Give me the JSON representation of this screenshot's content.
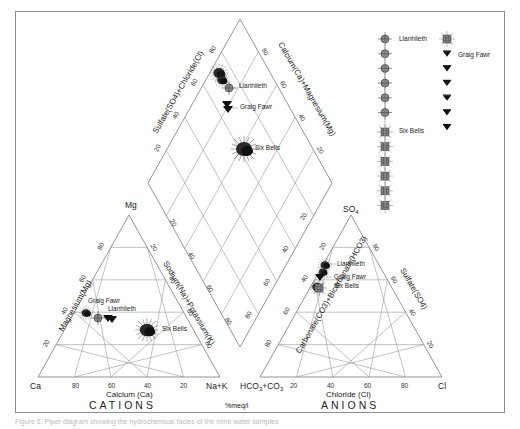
{
  "chart_data": {
    "type": "scatter",
    "subtype": "piper-trilinear",
    "units_label": "%meq/l",
    "cation_triangle": {
      "title": "CATIONS",
      "vertices": {
        "left": "Ca",
        "top": "Mg",
        "right": "Na+K"
      },
      "bottom_axis_label": "Calcium (Ca)",
      "left_axis_label": "Magnesium(Mg)",
      "right_axis_label": "Sodium(Na)+Potassium(K)",
      "ticks": [
        20,
        40,
        60,
        80
      ]
    },
    "anion_triangle": {
      "title": "ANIONS",
      "vertices": {
        "left": "HCO3+CO3",
        "top": "SO4",
        "right": "Cl"
      },
      "bottom_axis_label": "Chloride (Cl)",
      "left_axis_label": "Carbonate(CO3)+Bicarbonate(HCO3)",
      "right_axis_label": "Sulfate(SO4)",
      "ticks": [
        20,
        40,
        60,
        80
      ]
    },
    "diamond": {
      "upper_left_axis_label": "Sulfate(SO4)+Chloride(Cl)",
      "upper_right_axis_label": "Calcium(Ca)+Magnesium(Mg)",
      "lower_left_axis_label": "Sodium(Na)+Potassium(K)",
      "lower_right_axis_label": "Carbonate(CO3)+Bicarbonate(HCO3)",
      "ticks": [
        20,
        40,
        60,
        80
      ]
    },
    "series": [
      {
        "name": "Llanhileth",
        "marker": "circle-cross",
        "cations": {
          "Ca": 62,
          "Mg": 38,
          "NaK": 0
        },
        "anions": {
          "HCO3CO3": 24,
          "SO4": 74,
          "Cl": 2
        },
        "diamond": {
          "SO4Cl": 76,
          "CaMg": 100
        }
      },
      {
        "name": "Graig Fawr",
        "marker": "triangle-down",
        "cations": {
          "Ca": 57,
          "Mg": 38,
          "NaK": 5
        },
        "anions": {
          "HCO3CO3": 30,
          "SO4": 67,
          "Cl": 3
        },
        "diamond": {
          "SO4Cl": 70,
          "CaMg": 95
        }
      },
      {
        "name": "Six Bells",
        "marker": "star-square",
        "cations": {
          "Ca": 38,
          "Mg": 31,
          "NaK": 31
        },
        "anions": {
          "HCO3CO3": 35,
          "SO4": 62,
          "Cl": 3
        },
        "diamond": {
          "SO4Cl": 65,
          "CaMg": 69
        }
      },
      {
        "name": "Llanhileth-cluster",
        "marker": "filled-blob",
        "cations": {
          "Ca": 67,
          "Mg": 39,
          "NaK": 0
        },
        "anions": {
          "HCO3CO3": 20,
          "SO4": 78,
          "Cl": 2
        },
        "diamond": {
          "SO4Cl": 82,
          "CaMg": 100
        }
      }
    ],
    "legend": {
      "position": "top-right",
      "columns": [
        {
          "entries": [
            {
              "label": "Llanhileth",
              "marker": "circle-cross",
              "count": 6
            },
            {
              "label": "Six Bells",
              "marker": "star-square",
              "count": 6
            }
          ]
        },
        {
          "entries": [
            {
              "label": "",
              "marker": "star-square",
              "count": 1
            },
            {
              "label": "Graig Fawr",
              "marker": "triangle-down",
              "count": 6
            }
          ]
        }
      ]
    }
  },
  "labels": {
    "cations_title": "CATIONS",
    "anions_title": "ANIONS",
    "units": "%meq/l",
    "ca": "Ca",
    "mg": "Mg",
    "nak": "Na+K",
    "hco3": "HCO",
    "hco3_sub": "3",
    "co3": "+CO",
    "co3_sub": "3",
    "so4": "SO",
    "so4_sub": "4",
    "cl": "Cl",
    "calcium_axis": "Calcium (Ca)",
    "chloride_axis": "Chloride (Cl)",
    "magnesium_axis": "Magnesium(Mg)",
    "sodium_axis": "Sodium(Na)+Potassium(K)",
    "carbonate_axis": "Carbonate(CO3)+Bicarbonate(HCO3)",
    "sulfate_axis": "Sulfate(SO4)",
    "diamond_ul_axis": "Sulfate(SO4)+Chloride(Cl)",
    "diamond_ur_axis": "Calcium(Ca)+Magnesium(Mg)",
    "pt_llanhileth": "Llanhileth",
    "pt_graig": "Graig Fawr",
    "pt_sixbells": "Six Bells",
    "leg_llanhileth": "Llanhileth",
    "leg_graig": "Graig Fawr",
    "leg_sixbells": "Six Bells",
    "t20": "20",
    "t40": "40",
    "t60": "60",
    "t80": "80"
  },
  "caption": "Figure 5. Piper diagram showing the hydrochemical facies of the mine water samples"
}
